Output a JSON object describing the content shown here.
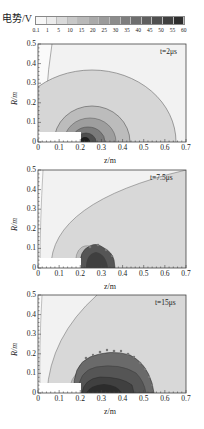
{
  "colorbar": {
    "title": "电势/V",
    "ticks": [
      "0.1",
      "1",
      "5",
      "10",
      "15",
      "20",
      "25",
      "30",
      "35",
      "40",
      "45",
      "50",
      "55",
      "60"
    ],
    "colors": [
      "#f7f7f7",
      "#ececec",
      "#dadada",
      "#c8c8c8",
      "#b9b9b9",
      "#aaaaaa",
      "#9b9b9b",
      "#8c8c8c",
      "#7d7d7d",
      "#6e6e6e",
      "#5f5f5f",
      "#505050",
      "#404040",
      "#2e2e2e"
    ]
  },
  "panels": [
    {
      "time_label": "t=2μs",
      "xlabel": "z/m",
      "ylabel": "R/m"
    },
    {
      "time_label": "t=7.5μs",
      "xlabel": "z/m",
      "ylabel": "R/m"
    },
    {
      "time_label": "t=15μs",
      "xlabel": "z/m",
      "ylabel": "R/m"
    }
  ],
  "axes": {
    "x_ticks": [
      "0",
      "0.1",
      "0.2",
      "0.3",
      "0.4",
      "0.5",
      "0.6",
      "0.7"
    ],
    "y_ticks": [
      "0",
      "0.1",
      "0.2",
      "0.3",
      "0.4",
      "0.5"
    ]
  },
  "chart_data": [
    {
      "type": "heatmap",
      "title": "t=2μs",
      "xlabel": "z/m",
      "ylabel": "R/m",
      "xlim": [
        0,
        0.7
      ],
      "ylim": [
        0,
        0.5
      ],
      "colorbar_label": "电势/V",
      "colorbar_levels": [
        0.1,
        1,
        5,
        10,
        15,
        20,
        25,
        30,
        35,
        40,
        45,
        50,
        55,
        60
      ],
      "electrode": {
        "z": [
          0,
          0.2
        ],
        "R": [
          0,
          0.05
        ]
      },
      "contours": [
        {
          "level": 0.1,
          "shape": "near-vertical boundary",
          "z_at_R0": 0.04,
          "z_at_R05": 0.07
        },
        {
          "level": 1,
          "center_z": 0.22,
          "radius_z": 0.4,
          "R_max": 0.37
        },
        {
          "level": 5,
          "center_z": 0.22,
          "radius_z": 0.18,
          "R_max": 0.18
        },
        {
          "level": 10,
          "center_z": 0.22,
          "radius_z": 0.12,
          "R_max": 0.12
        },
        {
          "level": 20,
          "center_z": 0.22,
          "radius_z": 0.07,
          "R_max": 0.07
        },
        {
          "level": 40,
          "center_z": 0.22,
          "radius_z": 0.03,
          "R_max": 0.03
        }
      ]
    },
    {
      "type": "heatmap",
      "title": "t=7.5μs",
      "xlabel": "z/m",
      "ylabel": "R/m",
      "xlim": [
        0,
        0.7
      ],
      "ylim": [
        0,
        0.5
      ],
      "colorbar_label": "电势/V",
      "electrode": {
        "z": [
          0,
          0.2
        ],
        "R": [
          0,
          0.05
        ]
      },
      "contours": [
        {
          "level": 0.1,
          "shape": "near-vertical boundary",
          "z_at_R0": 0.01,
          "z_at_R05": 0.03
        },
        {
          "level": 1,
          "shape": "parabolic front",
          "z_at_R0": 0.06,
          "z_at_R05": 0.68
        },
        {
          "level": 5,
          "region": "z 0.18-0.28, R<0.11"
        },
        {
          "level": 40,
          "region": "irregular dark blob z 0.2-0.37, R<0.1"
        }
      ]
    },
    {
      "type": "heatmap",
      "title": "t=15μs",
      "xlabel": "z/m",
      "ylabel": "R/m",
      "xlim": [
        0,
        0.7
      ],
      "ylim": [
        0,
        0.5
      ],
      "colorbar_label": "电势/V",
      "electrode": {
        "z": [
          0,
          0.2
        ],
        "R": [
          0,
          0.05
        ]
      },
      "contours": [
        {
          "level": 0.1,
          "shape": "near-vertical boundary",
          "z_at_R0": 0.01,
          "z_at_R05": 0.02
        },
        {
          "level": 1,
          "shape": "arc front",
          "z_at_R0": 0.04,
          "z_at_R05": 0.28
        },
        {
          "level": 5,
          "region": "z 0.15-0.56, R<0.1"
        },
        {
          "level": 30,
          "region": "irregular dark lobe z 0.17-0.55, R<0.21"
        },
        {
          "level": 45,
          "region": "inner core z 0.2-0.48, R<0.12"
        }
      ]
    }
  ]
}
